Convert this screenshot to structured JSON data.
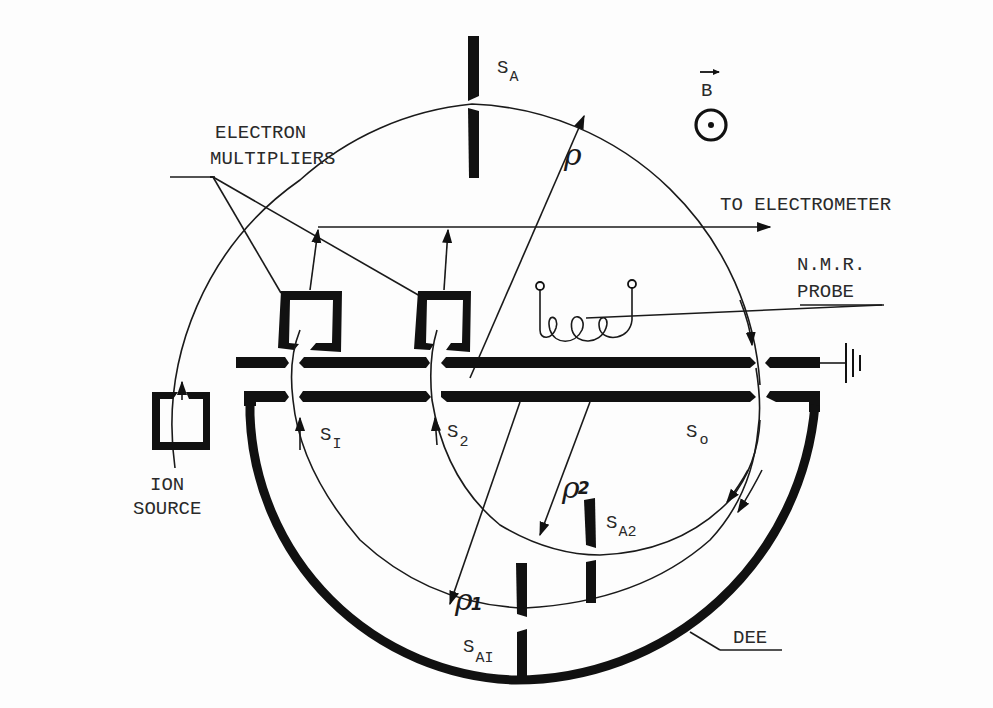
{
  "diagram": {
    "type": "mass-spectrometer schematic (synchrometer / cyclotron-resonance)",
    "colors": {
      "ink": "#111111",
      "background": "#fdfdfd"
    },
    "labels": {
      "field": "B",
      "electron_multipliers_line1": "ELECTRON",
      "electron_multipliers_line2": "MULTIPLIERS",
      "to_electrometer": "TO ELECTROMETER",
      "nmr_line1": "N.M.R.",
      "nmr_line2": "PROBE",
      "ion_source_line1": "ION",
      "ion_source_line2": "SOURCE",
      "dee": "DEE",
      "slit_a": {
        "main": "S",
        "sub": "A"
      },
      "slit_1": {
        "main": "S",
        "sub": "I"
      },
      "slit_2": {
        "main": "S",
        "sub": "2"
      },
      "slit_0": {
        "main": "S",
        "sub": "o"
      },
      "slit_a1": {
        "main": "S",
        "sub": "AI"
      },
      "slit_a2": {
        "main": "S",
        "sub": "A2"
      },
      "rho": {
        "main": "ρ",
        "sub": ""
      },
      "rho_1": {
        "main": "ρ",
        "sub": "1"
      },
      "rho_2": {
        "main": "ρ",
        "sub": "2"
      }
    },
    "icons": [
      "field-out-of-page-icon",
      "ground-icon",
      "nmr-coil-icon"
    ]
  }
}
